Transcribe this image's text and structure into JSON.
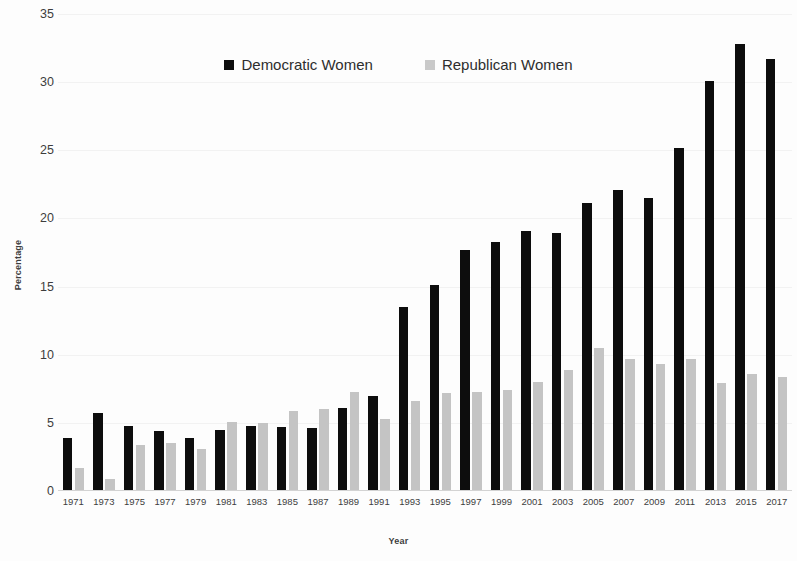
{
  "chart_data": {
    "type": "bar",
    "title": "",
    "subtitle": "",
    "xlabel": "Year",
    "ylabel": "Percentage",
    "ylim": [
      0,
      35
    ],
    "ytick_values": [
      0,
      5,
      10,
      15,
      20,
      25,
      30,
      35
    ],
    "ytick_labels": [
      "0",
      "5",
      "10",
      "15",
      "20",
      "25",
      "30",
      "35"
    ],
    "grid": true,
    "legend_position": "top-center",
    "categories": [
      "1971",
      "1973",
      "1975",
      "1977",
      "1979",
      "1981",
      "1983",
      "1985",
      "1987",
      "1989",
      "1991",
      "1993",
      "1995",
      "1997",
      "1999",
      "2001",
      "2003",
      "2005",
      "2007",
      "2009",
      "2011",
      "2013",
      "2015",
      "2017"
    ],
    "series": [
      {
        "name": "Democratic Women",
        "color": "#0d0d0d",
        "values": [
          3.9,
          5.7,
          4.8,
          4.4,
          3.9,
          4.5,
          4.8,
          4.7,
          4.6,
          6.1,
          7.0,
          13.5,
          15.1,
          17.7,
          18.3,
          19.1,
          18.9,
          21.1,
          22.1,
          21.5,
          25.2,
          30.1,
          32.8,
          31.7
        ]
      },
      {
        "name": "Republican Women",
        "color": "#c4c4c4",
        "values": [
          1.7,
          0.9,
          3.4,
          3.5,
          3.1,
          5.1,
          5.0,
          5.9,
          6.0,
          7.3,
          5.3,
          6.6,
          7.2,
          7.3,
          7.4,
          8.0,
          8.9,
          10.5,
          9.7,
          9.3,
          9.7,
          7.9,
          8.6,
          8.4
        ]
      }
    ]
  },
  "legend": {
    "items": [
      {
        "label": "Democratic Women",
        "swatch": "black-square-icon"
      },
      {
        "label": "Republican Women",
        "swatch": "gray-square-icon"
      }
    ]
  },
  "axes": {
    "y_title": "Percentage",
    "x_title": "Year"
  }
}
